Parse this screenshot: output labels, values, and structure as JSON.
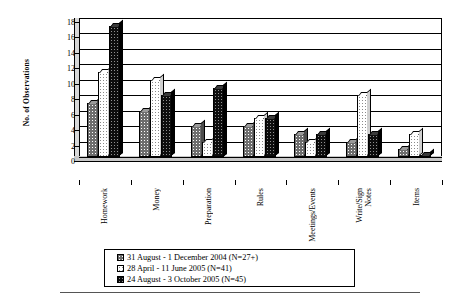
{
  "chart_data": {
    "type": "bar",
    "title": "",
    "xlabel": "",
    "ylabel": "No. of Observations",
    "ylim": [
      0,
      18
    ],
    "ytick_step": 2,
    "yticks": [
      0,
      2,
      4,
      6,
      8,
      10,
      12,
      14,
      16,
      18
    ],
    "grid": true,
    "legend_position": "bottom",
    "categories": [
      "Homework",
      "Money",
      "Preparation",
      "Rules",
      "Meetings/Events",
      "Write/Sign\nNotes",
      "Items"
    ],
    "series": [
      {
        "name": "31 August - 1 December 2004 (N=27+)",
        "values": [
          7,
          6,
          4,
          4,
          3,
          2,
          1
        ]
      },
      {
        "name": "28 April - 11 June 2005 (N=41)",
        "values": [
          11,
          10,
          2,
          5,
          2,
          8,
          3
        ]
      },
      {
        "name": "24 August - 3 October 2005 (N=45)",
        "values": [
          17,
          8,
          9,
          5,
          3,
          3,
          0.3
        ]
      }
    ]
  },
  "axis": {
    "y_title": "No. of Observations",
    "y_labels": [
      "18",
      "16",
      "14",
      "12",
      "10",
      "8",
      "6",
      "4",
      "2",
      "0"
    ],
    "x_labels": [
      "Homework",
      "Money",
      "Preparation",
      "Rules",
      "Meetings/Events",
      "Write/Sign Notes",
      "Items"
    ]
  },
  "legend": {
    "items": [
      {
        "label": "31 August - 1 December 2004 (N=27+)",
        "swatch": "series-0-swatch"
      },
      {
        "label": "28 April - 11 June 2005 (N=41)",
        "swatch": "series-1-swatch"
      },
      {
        "label": "24 August - 3 October 2005 (N=45)",
        "swatch": "series-2-swatch"
      }
    ]
  },
  "colors": {
    "series_0": "#6e6e6e",
    "series_1": "#ffffff",
    "series_2": "#0d0d0d",
    "axis": "#000000",
    "background": "#ffffff"
  }
}
